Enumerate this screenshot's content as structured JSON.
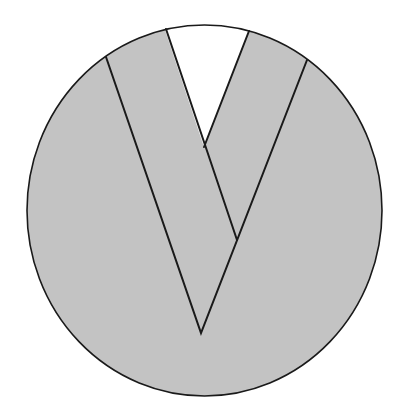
{
  "diagram": {
    "shape": "circle-with-v-bands",
    "colors": {
      "background": "#ffffff",
      "fill": "#c3c3c3",
      "stroke": "#1a1a1a",
      "wedge": "#ffffff"
    },
    "ellipse": {
      "cx": 204.5,
      "cy": 210.5,
      "rx": 177.5,
      "ry": 185.5
    },
    "points": {
      "outer_left_top": [
        106,
        57
      ],
      "inner_left_top": [
        166,
        29
      ],
      "inner_right_top": [
        249,
        31
      ],
      "outer_right_top": [
        307,
        60
      ],
      "inner_vertex": [
        204,
        147
      ],
      "crossing": [
        237,
        240
      ],
      "bottom_vertex": [
        201,
        333
      ]
    }
  }
}
